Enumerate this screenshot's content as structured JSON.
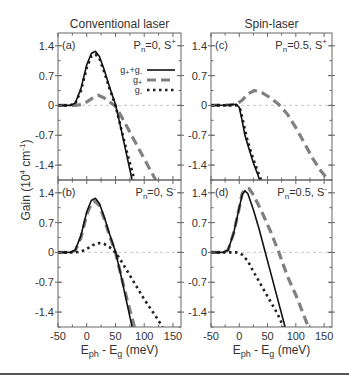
{
  "chart_data": {
    "type": "line",
    "column_titles": [
      "Conventional laser",
      "Spin-laser"
    ],
    "ylabel": "Gain (10^4 cm^-1)",
    "ylabel_parts": {
      "base": "Gain (10",
      "sup1": "4",
      "mid": " cm",
      "sup2": "-1",
      "end": ")"
    },
    "xlabel": "E_ph - E_g (meV)",
    "xlabel_parts": {
      "E": "E",
      "sub1": "ph",
      "mid": " - E",
      "sub2": "g",
      "end": " (meV)"
    },
    "xlim": [
      -50,
      164
    ],
    "ylim": [
      -1.75,
      1.7
    ],
    "xticks": [
      -50,
      0,
      50,
      100,
      150
    ],
    "yticks": [
      1.4,
      0.7,
      0,
      -0.7,
      -1.4
    ],
    "ytick_labels": [
      "1.4",
      "0.7",
      "0",
      "-0.7",
      "-1.4"
    ],
    "grid": false,
    "zero_line": true,
    "legend": {
      "panel": "a",
      "entries": [
        {
          "label_base": "g",
          "label_sub1": "+",
          "label_mid": "+g",
          "label_sub2": "-",
          "style": "solid",
          "series": "g_plus_plus_g_minus"
        },
        {
          "label_base": "g",
          "label_sub1": "+",
          "label_mid": "",
          "label_sub2": "",
          "style": "dashed",
          "series": "g_plus"
        },
        {
          "label_base": "g",
          "label_sub1": "-",
          "label_mid": "",
          "label_sub2": "",
          "style": "dotted",
          "series": "g_minus"
        }
      ]
    },
    "styles": {
      "solid": {
        "color": "#111111",
        "width": 1.6,
        "dash": ""
      },
      "dashed": {
        "color": "#808080",
        "width": 3.2,
        "dash": "9,5"
      },
      "dotted": {
        "color": "#222222",
        "width": 2.6,
        "dash": "2.5,3.5"
      }
    },
    "panels": [
      {
        "id": "a",
        "tag": "(a)",
        "P_label": "P",
        "P_sub": "n",
        "P_value": "=0, S",
        "P_sup": "+",
        "series": {
          "g_plus_plus_g_minus": [
            [
              -50,
              0
            ],
            [
              -30,
              0
            ],
            [
              -20,
              0.05
            ],
            [
              -10,
              0.4
            ],
            [
              0,
              0.95
            ],
            [
              8,
              1.22
            ],
            [
              15,
              1.27
            ],
            [
              22,
              1.15
            ],
            [
              30,
              0.85
            ],
            [
              40,
              0.42
            ],
            [
              50,
              0.02
            ],
            [
              58,
              -0.45
            ],
            [
              66,
              -0.95
            ],
            [
              74,
              -1.45
            ],
            [
              79,
              -1.75
            ]
          ],
          "g_plus": [
            [
              -50,
              0
            ],
            [
              -20,
              0
            ],
            [
              -10,
              0.02
            ],
            [
              0,
              0.08
            ],
            [
              10,
              0.17
            ],
            [
              20,
              0.24
            ],
            [
              30,
              0.18
            ],
            [
              40,
              0.08
            ],
            [
              50,
              -0.02
            ],
            [
              60,
              -0.25
            ],
            [
              80,
              -0.75
            ],
            [
              100,
              -1.25
            ],
            [
              112,
              -1.55
            ],
            [
              120,
              -1.75
            ]
          ],
          "g_minus": [
            [
              -50,
              0
            ],
            [
              -30,
              0
            ],
            [
              -20,
              0.04
            ],
            [
              -10,
              0.35
            ],
            [
              0,
              0.88
            ],
            [
              8,
              1.15
            ],
            [
              15,
              1.2
            ],
            [
              22,
              1.1
            ],
            [
              30,
              0.8
            ],
            [
              40,
              0.38
            ],
            [
              50,
              0.0
            ],
            [
              60,
              -0.55
            ],
            [
              70,
              -1.1
            ],
            [
              78,
              -1.5
            ],
            [
              83,
              -1.75
            ]
          ]
        }
      },
      {
        "id": "c",
        "tag": "(c)",
        "P_label": "P",
        "P_sub": "n",
        "P_value": "=0.5, S",
        "P_sup": "+",
        "series": {
          "g_plus_plus_g_minus": [
            [
              -50,
              0
            ],
            [
              -20,
              0.01
            ],
            [
              -5,
              0.03
            ],
            [
              0,
              -0.05
            ],
            [
              5,
              -0.35
            ],
            [
              10,
              -0.7
            ],
            [
              18,
              -1.05
            ],
            [
              25,
              -1.35
            ],
            [
              32,
              -1.6
            ],
            [
              36,
              -1.75
            ]
          ],
          "g_plus": [
            [
              -50,
              0
            ],
            [
              -20,
              0.01
            ],
            [
              -5,
              0.03
            ],
            [
              5,
              0.12
            ],
            [
              15,
              0.27
            ],
            [
              27,
              0.35
            ],
            [
              40,
              0.3
            ],
            [
              55,
              0.18
            ],
            [
              70,
              0.02
            ],
            [
              85,
              -0.2
            ],
            [
              100,
              -0.52
            ],
            [
              115,
              -0.88
            ],
            [
              130,
              -1.25
            ],
            [
              145,
              -1.55
            ],
            [
              158,
              -1.75
            ]
          ],
          "g_minus": [
            [
              -50,
              0
            ],
            [
              -20,
              0.0
            ],
            [
              -5,
              0.0
            ],
            [
              2,
              -0.1
            ],
            [
              8,
              -0.45
            ],
            [
              14,
              -0.8
            ],
            [
              22,
              -1.15
            ],
            [
              30,
              -1.45
            ],
            [
              37,
              -1.7
            ],
            [
              39,
              -1.75
            ]
          ]
        }
      },
      {
        "id": "b",
        "tag": "(b)",
        "P_label": "P",
        "P_sub": "n",
        "P_value": "=0, S",
        "P_sup": "-",
        "series": {
          "g_plus_plus_g_minus": [
            [
              -50,
              0
            ],
            [
              -30,
              0
            ],
            [
              -20,
              0.05
            ],
            [
              -10,
              0.4
            ],
            [
              0,
              0.95
            ],
            [
              8,
              1.22
            ],
            [
              15,
              1.27
            ],
            [
              22,
              1.15
            ],
            [
              30,
              0.85
            ],
            [
              40,
              0.42
            ],
            [
              50,
              0.02
            ],
            [
              58,
              -0.45
            ],
            [
              66,
              -0.95
            ],
            [
              74,
              -1.45
            ],
            [
              79,
              -1.75
            ]
          ],
          "g_plus": [
            [
              -50,
              0
            ],
            [
              -30,
              0
            ],
            [
              -20,
              0.04
            ],
            [
              -10,
              0.35
            ],
            [
              0,
              0.88
            ],
            [
              8,
              1.15
            ],
            [
              15,
              1.2
            ],
            [
              22,
              1.1
            ],
            [
              30,
              0.8
            ],
            [
              40,
              0.38
            ],
            [
              50,
              0.0
            ],
            [
              60,
              -0.55
            ],
            [
              70,
              -1.1
            ],
            [
              78,
              -1.5
            ],
            [
              83,
              -1.75
            ]
          ],
          "g_minus": [
            [
              -50,
              0
            ],
            [
              -20,
              0
            ],
            [
              -10,
              0.02
            ],
            [
              0,
              0.08
            ],
            [
              10,
              0.17
            ],
            [
              20,
              0.22
            ],
            [
              30,
              0.2
            ],
            [
              40,
              0.12
            ],
            [
              50,
              0.0
            ],
            [
              60,
              -0.2
            ],
            [
              80,
              -0.65
            ],
            [
              100,
              -1.1
            ],
            [
              120,
              -1.5
            ],
            [
              132,
              -1.75
            ]
          ]
        }
      },
      {
        "id": "d",
        "tag": "(d)",
        "P_label": "P",
        "P_sub": "n",
        "P_value": "=0.5, S",
        "P_sup": "-",
        "series": {
          "g_plus_plus_g_minus": [
            [
              -50,
              0
            ],
            [
              -30,
              0
            ],
            [
              -20,
              0.05
            ],
            [
              -10,
              0.45
            ],
            [
              0,
              1.05
            ],
            [
              5,
              1.35
            ],
            [
              10,
              1.45
            ],
            [
              15,
              1.38
            ],
            [
              25,
              1.0
            ],
            [
              35,
              0.55
            ],
            [
              45,
              0.05
            ],
            [
              55,
              -0.45
            ],
            [
              65,
              -0.95
            ],
            [
              75,
              -1.45
            ],
            [
              81,
              -1.75
            ]
          ],
          "g_plus": [
            [
              -50,
              0
            ],
            [
              -30,
              0
            ],
            [
              -20,
              0.05
            ],
            [
              -10,
              0.45
            ],
            [
              0,
              1.05
            ],
            [
              5,
              1.38
            ],
            [
              10,
              1.48
            ],
            [
              17,
              1.5
            ],
            [
              25,
              1.35
            ],
            [
              40,
              0.95
            ],
            [
              55,
              0.5
            ],
            [
              70,
              0.0
            ],
            [
              85,
              -0.55
            ],
            [
              100,
              -1.0
            ],
            [
              112,
              -1.4
            ],
            [
              122,
              -1.75
            ]
          ],
          "g_minus": [
            [
              -50,
              0
            ],
            [
              -20,
              0
            ],
            [
              -5,
              0.0
            ],
            [
              5,
              -0.05
            ],
            [
              15,
              -0.2
            ],
            [
              25,
              -0.45
            ],
            [
              40,
              -0.8
            ],
            [
              55,
              -1.15
            ],
            [
              68,
              -1.45
            ],
            [
              78,
              -1.75
            ]
          ]
        }
      }
    ]
  },
  "labels": {
    "column_titles": [
      "Conventional laser",
      "Spin-laser"
    ]
  }
}
